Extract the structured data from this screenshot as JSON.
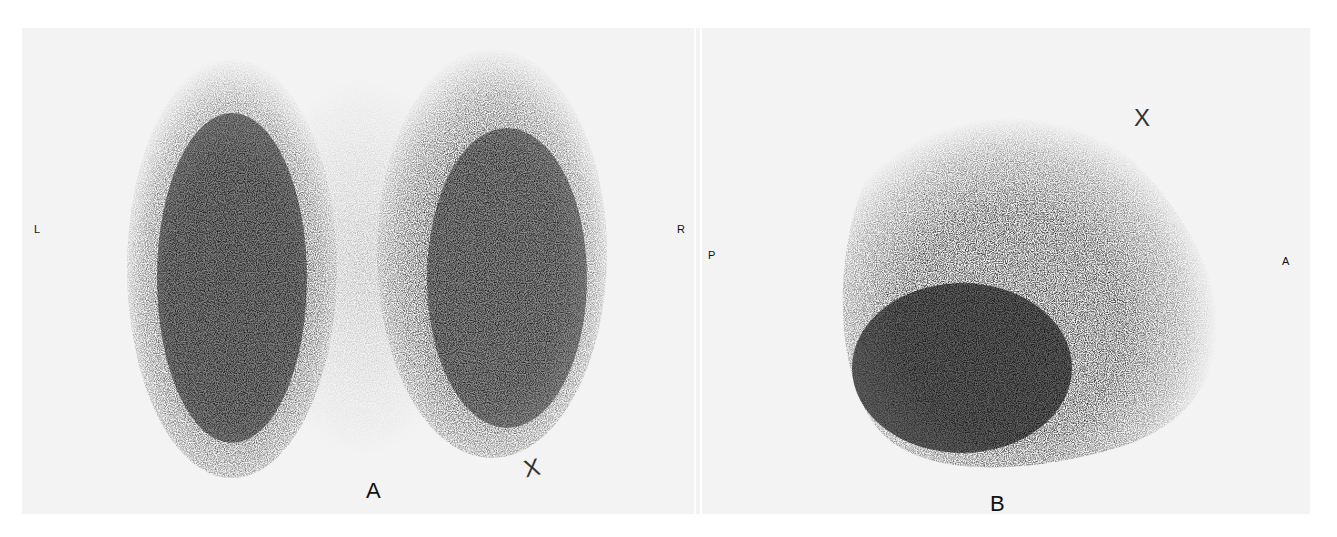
{
  "figure": {
    "panels": [
      {
        "id": "A",
        "caption": "A",
        "view": "anterior/posterior (frontal)",
        "orientation_left": "L",
        "orientation_right": "R",
        "marker": "X"
      },
      {
        "id": "B",
        "caption": "B",
        "view": "lateral",
        "orientation_left": "P",
        "orientation_right": "A",
        "marker": "X"
      }
    ],
    "colors": {
      "background": "#ffffff",
      "panel": "#f3f3f3",
      "activity": "#000000"
    }
  }
}
